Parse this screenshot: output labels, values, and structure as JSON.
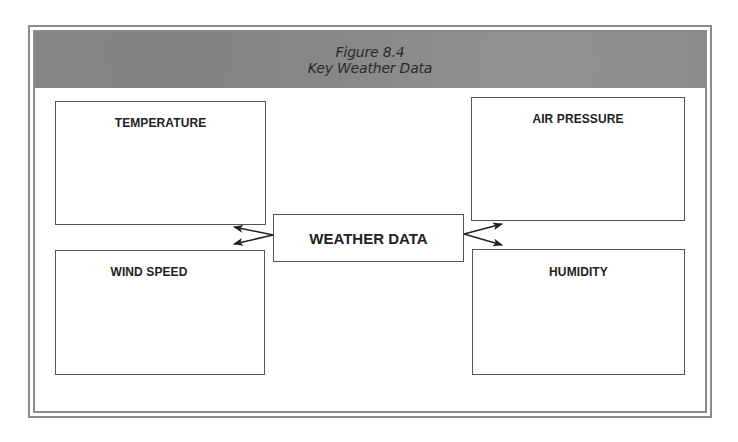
{
  "figure": {
    "number_label": "Figure 8.4",
    "title": "Key Weather Data",
    "header_color": "#8a8a8a"
  },
  "diagram": {
    "center": {
      "label": "WEATHER DATA"
    },
    "nodes": [
      {
        "id": "temperature",
        "label": "TEMPERATURE",
        "position": "top-left"
      },
      {
        "id": "wind_speed",
        "label": "WIND SPEED",
        "position": "bottom-left"
      },
      {
        "id": "air_pressure",
        "label": "AIR PRESSURE",
        "position": "top-right"
      },
      {
        "id": "humidity",
        "label": "HUMIDITY",
        "position": "bottom-right"
      }
    ],
    "connections": [
      {
        "from": "center",
        "to": "temperature"
      },
      {
        "from": "center",
        "to": "wind_speed"
      },
      {
        "from": "center",
        "to": "air_pressure"
      },
      {
        "from": "center",
        "to": "humidity"
      }
    ]
  }
}
